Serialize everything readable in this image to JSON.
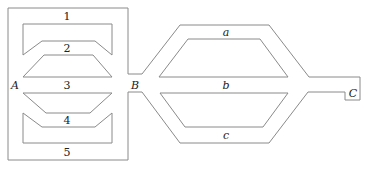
{
  "diagram": {
    "type": "network-of-channels",
    "nodes": {
      "A": "A",
      "B": "B",
      "C": "C"
    },
    "left_network": {
      "from": "A",
      "to": "B",
      "paths": [
        "1",
        "2",
        "3",
        "4",
        "5"
      ]
    },
    "right_network": {
      "from": "B",
      "to": "C",
      "paths": [
        "a",
        "b",
        "c"
      ]
    },
    "colors": {
      "stroke": "#8a8a8a",
      "text": "#222222",
      "background": "#ffffff"
    }
  }
}
